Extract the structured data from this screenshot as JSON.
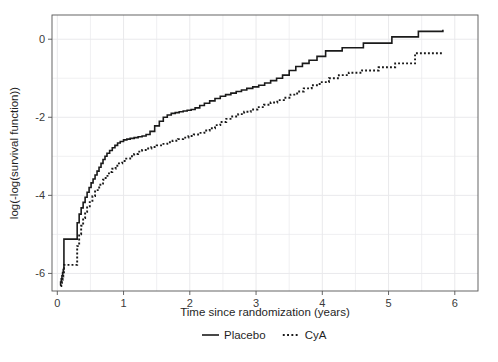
{
  "chart_data": {
    "type": "line",
    "title": "",
    "subtitle": "",
    "xlabel": "Time since randomization (years)",
    "ylabel": "log(-log(survival function))",
    "xlim": [
      -0.08,
      6.35
    ],
    "ylim": [
      -6.45,
      0.62
    ],
    "xticks": [
      0,
      1,
      2,
      3,
      4,
      5,
      6
    ],
    "xtick_labels": [
      "0",
      "1",
      "2",
      "3",
      "4",
      "5",
      "6"
    ],
    "yticks": [
      0,
      -2,
      -4,
      -6
    ],
    "ytick_labels": [
      "0",
      "-2",
      "-4",
      "-6"
    ],
    "grid": true,
    "grid_color": "#e9e9ec",
    "grid_x_step": 0.5,
    "grid_y_step": 1,
    "legend_position": "bottom-center",
    "legend": [
      {
        "name": "Placebo",
        "style": "solid",
        "color": "#1a1a1a"
      },
      {
        "name": "CyA",
        "style": "dotted",
        "color": "#1a1a1a"
      }
    ],
    "series": [
      {
        "name": "Placebo",
        "style": "solid",
        "color": "#1a1a1a",
        "drawstyle": "steps-post",
        "x": [
          0.04,
          0.05,
          0.06,
          0.07,
          0.08,
          0.09,
          0.1,
          0.11,
          0.26,
          0.3,
          0.33,
          0.36,
          0.39,
          0.42,
          0.45,
          0.48,
          0.51,
          0.54,
          0.57,
          0.6,
          0.63,
          0.66,
          0.69,
          0.72,
          0.75,
          0.79,
          0.83,
          0.87,
          0.91,
          0.95,
          1.0,
          1.05,
          1.1,
          1.16,
          1.22,
          1.28,
          1.34,
          1.4,
          1.47,
          1.54,
          1.6,
          1.66,
          1.72,
          1.78,
          1.84,
          1.9,
          1.96,
          2.02,
          2.08,
          2.15,
          2.22,
          2.3,
          2.38,
          2.46,
          2.54,
          2.62,
          2.7,
          2.78,
          2.86,
          2.95,
          3.04,
          3.13,
          3.22,
          3.31,
          3.4,
          3.5,
          3.6,
          3.7,
          3.8,
          3.92,
          4.05,
          4.3,
          4.62,
          5.05,
          5.45,
          5.82
        ],
        "y": [
          -6.3,
          -6.22,
          -6.14,
          -6.06,
          -5.98,
          -5.9,
          -5.12,
          -5.12,
          -5.12,
          -4.7,
          -4.48,
          -4.32,
          -4.18,
          -4.05,
          -3.92,
          -3.8,
          -3.68,
          -3.58,
          -3.48,
          -3.38,
          -3.28,
          -3.18,
          -3.08,
          -3.0,
          -2.92,
          -2.85,
          -2.78,
          -2.72,
          -2.66,
          -2.62,
          -2.58,
          -2.56,
          -2.54,
          -2.52,
          -2.5,
          -2.48,
          -2.44,
          -2.36,
          -2.22,
          -2.1,
          -2.0,
          -1.94,
          -1.9,
          -1.88,
          -1.86,
          -1.84,
          -1.82,
          -1.8,
          -1.76,
          -1.7,
          -1.64,
          -1.58,
          -1.52,
          -1.46,
          -1.42,
          -1.38,
          -1.34,
          -1.3,
          -1.26,
          -1.22,
          -1.18,
          -1.12,
          -1.06,
          -1.0,
          -0.92,
          -0.8,
          -0.7,
          -0.62,
          -0.54,
          -0.44,
          -0.3,
          -0.22,
          -0.1,
          0.06,
          0.2,
          0.24
        ]
      },
      {
        "name": "CyA",
        "style": "dotted",
        "color": "#1a1a1a",
        "drawstyle": "steps-post",
        "x": [
          0.05,
          0.06,
          0.07,
          0.08,
          0.09,
          0.1,
          0.12,
          0.14,
          0.27,
          0.3,
          0.33,
          0.36,
          0.39,
          0.42,
          0.45,
          0.49,
          0.53,
          0.57,
          0.61,
          0.65,
          0.69,
          0.73,
          0.78,
          0.83,
          0.88,
          0.93,
          0.98,
          1.04,
          1.1,
          1.16,
          1.22,
          1.28,
          1.35,
          1.42,
          1.5,
          1.58,
          1.66,
          1.74,
          1.82,
          1.9,
          1.98,
          2.06,
          2.14,
          2.22,
          2.3,
          2.38,
          2.46,
          2.55,
          2.64,
          2.73,
          2.82,
          2.92,
          3.02,
          3.12,
          3.22,
          3.32,
          3.42,
          3.52,
          3.62,
          3.72,
          3.84,
          3.96,
          4.1,
          4.25,
          4.4,
          4.6,
          4.85,
          5.1,
          5.4,
          5.82
        ],
        "y": [
          -6.32,
          -6.24,
          -6.16,
          -6.08,
          -6.0,
          -5.78,
          -5.78,
          -5.78,
          -5.78,
          -5.3,
          -5.0,
          -4.78,
          -4.58,
          -4.42,
          -4.28,
          -4.14,
          -4.02,
          -3.9,
          -3.8,
          -3.7,
          -3.6,
          -3.5,
          -3.4,
          -3.32,
          -3.24,
          -3.18,
          -3.12,
          -3.06,
          -3.0,
          -2.94,
          -2.88,
          -2.84,
          -2.8,
          -2.76,
          -2.72,
          -2.68,
          -2.64,
          -2.6,
          -2.56,
          -2.52,
          -2.48,
          -2.44,
          -2.4,
          -2.34,
          -2.28,
          -2.2,
          -2.12,
          -2.04,
          -1.98,
          -1.92,
          -1.86,
          -1.8,
          -1.74,
          -1.68,
          -1.62,
          -1.56,
          -1.5,
          -1.42,
          -1.34,
          -1.26,
          -1.18,
          -1.1,
          -1.0,
          -0.92,
          -0.86,
          -0.8,
          -0.72,
          -0.62,
          -0.36,
          -0.34
        ]
      }
    ]
  },
  "axes": {
    "frame_color": "#555555"
  }
}
